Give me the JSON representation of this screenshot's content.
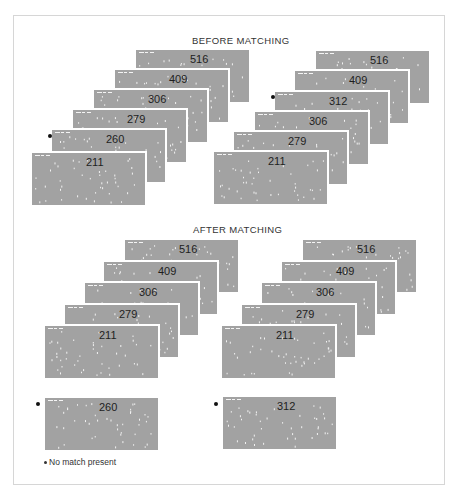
{
  "sections": {
    "before": {
      "title": "BEFORE MATCHING"
    },
    "after": {
      "title": "AFTER MATCHING"
    }
  },
  "stacks": {
    "before_left": [
      "516",
      "409",
      "306",
      "279",
      "260",
      "211"
    ],
    "before_right": [
      "516",
      "409",
      "312",
      "306",
      "279",
      "211"
    ],
    "after_left": [
      "516",
      "409",
      "306",
      "279",
      "211"
    ],
    "after_right": [
      "516",
      "409",
      "306",
      "279",
      "211"
    ]
  },
  "unmatched": {
    "left": "260",
    "right": "312"
  },
  "marked_cards": [
    "260",
    "312"
  ],
  "legend": {
    "symbol": "*",
    "text": "No match present"
  },
  "colors": {
    "card": "#a2a2a2",
    "frame_border": "#d6d6d6",
    "text": "#1e1e1e"
  }
}
